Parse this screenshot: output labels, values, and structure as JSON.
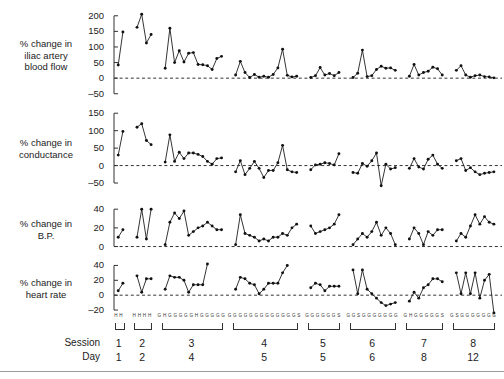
{
  "figure": {
    "panels": [
      {
        "id": "iliac-artery-blood-flow",
        "label_lines": [
          "% change in",
          "iliac artery",
          "blood flow"
        ],
        "ticks": [
          200,
          150,
          100,
          50,
          0,
          -50
        ],
        "ymin": -70,
        "ymax": 225
      },
      {
        "id": "conductance",
        "label_lines": [
          "% change in",
          "conductance"
        ],
        "ticks": [
          150,
          100,
          50,
          0,
          -50
        ],
        "ymin": -70,
        "ymax": 165
      },
      {
        "id": "blood-pressure",
        "label_lines": [
          "% change in",
          "B.P."
        ],
        "ticks": [
          40,
          20,
          0
        ],
        "ymin": -8,
        "ymax": 52
      },
      {
        "id": "heart-rate",
        "label_lines": [
          "% change in",
          "heart rate"
        ],
        "ticks": [
          40,
          20,
          0,
          -20
        ],
        "ymin": -28,
        "ymax": 50
      }
    ],
    "axis_rows": {
      "session_label": "Session",
      "day_label": "Day",
      "sessions": [
        "1",
        "2",
        "3",
        "4",
        "5",
        "6",
        "7",
        "8"
      ],
      "days": [
        "1",
        "2",
        "4",
        "5",
        "5",
        "6",
        "8",
        "12"
      ],
      "trial_codes": [
        "H H",
        "H H H H",
        "G H G G G G G H G G G G G",
        "G G G G G G G G G G G G G S",
        "G G G G G G S",
        "G G S G G G G G G G",
        "G H G G G G G S",
        "G S G G G G G G G"
      ]
    },
    "chart_data": {
      "type": "line",
      "title": "",
      "xlabel": "Session / Day",
      "ylabel": "% change",
      "grid": false,
      "legend": "none",
      "zero_reference_line": true,
      "series": [
        {
          "name": "% change in iliac artery blood flow",
          "ylim": [
            -70,
            225
          ],
          "ticks": [
            200,
            150,
            100,
            50,
            0,
            -50
          ],
          "groups": [
            {
              "session": "1",
              "values": [
                42,
                148
              ]
            },
            {
              "session": "2",
              "values": [
                163,
                205,
                113,
                140
              ]
            },
            {
              "session": "3",
              "values": [
                32,
                160,
                50,
                88,
                52,
                80,
                82,
                44,
                43,
                40,
                28,
                63,
                70
              ]
            },
            {
              "session": "4",
              "values": [
                10,
                54,
                18,
                2,
                12,
                3,
                6,
                3,
                12,
                33,
                93,
                9,
                4,
                6
              ]
            },
            {
              "session": "5",
              "values": [
                2,
                8,
                34,
                10,
                15,
                8,
                18
              ]
            },
            {
              "session": "6",
              "values": [
                2,
                16,
                90,
                5,
                8,
                28,
                38,
                32,
                33,
                25
              ]
            },
            {
              "session": "7",
              "values": [
                6,
                44,
                10,
                18,
                22,
                35,
                30,
                10
              ]
            },
            {
              "session": "8",
              "values": [
                25,
                40,
                10,
                3,
                8,
                10,
                5,
                4,
                1
              ]
            }
          ]
        },
        {
          "name": "% change in conductance",
          "ylim": [
            -70,
            165
          ],
          "ticks": [
            150,
            100,
            50,
            0,
            -50
          ],
          "groups": [
            {
              "session": "1",
              "values": [
                30,
                98
              ]
            },
            {
              "session": "2",
              "values": [
                110,
                120,
                72,
                60
              ]
            },
            {
              "session": "3",
              "values": [
                10,
                88,
                12,
                38,
                20,
                36,
                36,
                32,
                26,
                12,
                4,
                20,
                22
              ]
            },
            {
              "session": "4",
              "values": [
                -18,
                14,
                -26,
                -8,
                12,
                -8,
                -34,
                -14,
                -14,
                8,
                58,
                -12,
                -18,
                -20
              ]
            },
            {
              "session": "5",
              "values": [
                -12,
                2,
                4,
                8,
                6,
                2,
                34
              ]
            },
            {
              "session": "6",
              "values": [
                -20,
                -22,
                6,
                -2,
                14,
                36,
                -58,
                4,
                -10,
                -6
              ]
            },
            {
              "session": "7",
              "values": [
                -8,
                20,
                -4,
                -10,
                18,
                30,
                4,
                -8
              ]
            },
            {
              "session": "8",
              "values": [
                14,
                20,
                -14,
                -6,
                -18,
                -26,
                -22,
                -20,
                -18
              ]
            }
          ]
        },
        {
          "name": "% change in B.P.",
          "ylim": [
            -8,
            52
          ],
          "ticks": [
            40,
            20,
            0
          ],
          "groups": [
            {
              "session": "1",
              "values": [
                10,
                18
              ]
            },
            {
              "session": "2",
              "values": [
                10,
                40,
                8,
                40
              ]
            },
            {
              "session": "3",
              "values": [
                2,
                26,
                36,
                30,
                38,
                12,
                16,
                20,
                22,
                26,
                22,
                18,
                18
              ]
            },
            {
              "session": "4",
              "values": [
                2,
                34,
                14,
                12,
                10,
                6,
                8,
                6,
                10,
                10,
                14,
                12,
                20,
                24
              ]
            },
            {
              "session": "5",
              "values": [
                22,
                14,
                16,
                18,
                20,
                24,
                34
              ]
            },
            {
              "session": "6",
              "values": [
                2,
                8,
                14,
                10,
                16,
                26,
                12,
                20,
                14,
                2
              ]
            },
            {
              "session": "7",
              "values": [
                8,
                20,
                14,
                2,
                16,
                12,
                18,
                18
              ]
            },
            {
              "session": "8",
              "values": [
                6,
                14,
                10,
                22,
                34,
                24,
                32,
                26,
                24
              ]
            }
          ]
        },
        {
          "name": "% change in heart rate",
          "ylim": [
            -28,
            50
          ],
          "ticks": [
            40,
            20,
            0,
            -20
          ],
          "groups": [
            {
              "session": "1",
              "values": [
                6,
                16
              ]
            },
            {
              "session": "2",
              "values": [
                26,
                4,
                22,
                22
              ]
            },
            {
              "session": "3",
              "values": [
                8,
                26,
                24,
                24,
                20,
                4,
                14,
                14,
                14,
                42
              ]
            },
            {
              "session": "4",
              "values": [
                8,
                24,
                22,
                16,
                14,
                2,
                8,
                16,
                16,
                16,
                30,
                40
              ]
            },
            {
              "session": "5",
              "values": [
                10,
                16,
                14,
                6,
                12,
                12,
                12
              ]
            },
            {
              "session": "6",
              "values": [
                34,
                2,
                34,
                8,
                2,
                -4,
                -10,
                -14,
                -12,
                -10
              ]
            },
            {
              "session": "7",
              "values": [
                -8,
                4,
                -4,
                10,
                14,
                22,
                22,
                18
              ]
            },
            {
              "session": "8",
              "values": [
                30,
                2,
                30,
                2,
                30,
                -4,
                20,
                28,
                -24
              ]
            }
          ]
        }
      ]
    }
  }
}
